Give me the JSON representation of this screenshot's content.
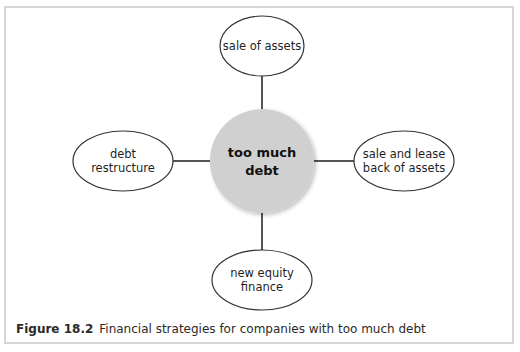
{
  "diagram": {
    "type": "hub-and-spoke",
    "hub": {
      "lines": [
        "too much",
        "debt"
      ],
      "fill": "#d0d0d0"
    },
    "nodes": [
      {
        "id": "top",
        "position": "top",
        "lines": [
          "sale of assets"
        ]
      },
      {
        "id": "left",
        "position": "left",
        "lines": [
          "debt",
          "restructure"
        ]
      },
      {
        "id": "right",
        "position": "right",
        "lines": [
          "sale and lease",
          "back of assets"
        ]
      },
      {
        "id": "bottom",
        "position": "bottom",
        "lines": [
          "new equity",
          "finance"
        ]
      }
    ],
    "connector_color": "#555555",
    "frame_color": "#d6d6d6"
  },
  "caption": {
    "figure_label": "Figure 18.2",
    "text": "Financial strategies for companies with too much debt"
  }
}
